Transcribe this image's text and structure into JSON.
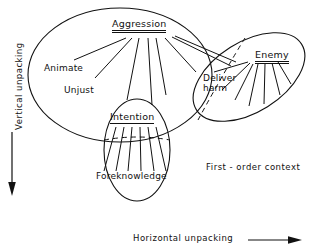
{
  "figure": {
    "title_present": false,
    "background_color": "#ffffff",
    "ink_color": "#111111",
    "width": 309,
    "height": 251
  },
  "nodes": {
    "aggression": {
      "label": "Aggression",
      "underline": "double"
    },
    "intention": {
      "label": "Intention",
      "underline": "single"
    },
    "enemy": {
      "label": "Enemy",
      "underline": "double"
    }
  },
  "leaves": {
    "animate": {
      "label": "Animate"
    },
    "unjust": {
      "label": "Unjust"
    },
    "foreknowledge": {
      "label": "Foreknowledge"
    },
    "deliver_harm": {
      "label_line1": "Deliver",
      "label_line2": "harm"
    }
  },
  "annotations": {
    "context": "First - order context"
  },
  "axes": {
    "vertical": {
      "label": "Vertical  unpacking",
      "arrow": "down"
    },
    "horizontal": {
      "label": "Horizontal  unpacking",
      "arrow": "right"
    }
  },
  "regions": {
    "main_ellipse": "first-order-context-ellipse",
    "intention_ellipse": "intention-subregion-ellipse",
    "enemy_ellipse": "enemy-subregion-ellipse"
  }
}
